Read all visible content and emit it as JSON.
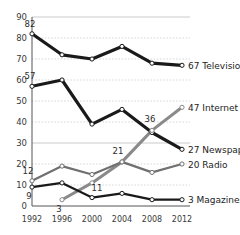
{
  "chart_data": {
    "type": "line",
    "title": "",
    "subtitle": "",
    "xlabel": "",
    "ylabel": "",
    "categories": [
      "1992",
      "1996",
      "2000",
      "2004",
      "2008",
      "2012"
    ],
    "ylim": [
      0,
      90
    ],
    "ytick_step": 10,
    "yticks": [
      "0",
      "10",
      "20",
      "30",
      "40",
      "50",
      "60",
      "70",
      "80",
      "90"
    ],
    "grid": true,
    "legend_position": "right-inline-end-of-line",
    "series": [
      {
        "name": "Television",
        "color": "#1a1a1a",
        "width": 3.2,
        "values": [
          82,
          72,
          70,
          76,
          68,
          67
        ],
        "start_label": "82",
        "end_label": "67",
        "end_name": "Television"
      },
      {
        "name": "Newspapers",
        "color": "#1a1a1a",
        "width": 3.2,
        "values": [
          57,
          60,
          39,
          46,
          35,
          27
        ],
        "start_label": "57",
        "end_label": "27",
        "end_name": "Newspapers"
      },
      {
        "name": "Internet",
        "color": "#8a8a8a",
        "width": 3.0,
        "values": [
          null,
          3,
          11,
          21,
          36,
          47
        ],
        "start_label": "3",
        "end_label": "47",
        "end_name": "Internet"
      },
      {
        "name": "Radio",
        "color": "#707070",
        "width": 2.2,
        "values": [
          12,
          19,
          15,
          21,
          16,
          20
        ],
        "start_label": "12",
        "end_label": "20",
        "end_name": "Radio"
      },
      {
        "name": "Magazines",
        "color": "#1a1a1a",
        "width": 2.2,
        "values": [
          9,
          11,
          4,
          6,
          3,
          3
        ],
        "start_label": "9",
        "end_label": "3",
        "end_name": "Magazines"
      }
    ],
    "annotations": [
      {
        "text": "82",
        "series": "Television",
        "x": "1992",
        "value": 82
      },
      {
        "text": "57",
        "series": "Newspapers",
        "x": "1992",
        "value": 57
      },
      {
        "text": "36",
        "series": "Internet",
        "x": "2008",
        "value": 36
      },
      {
        "text": "21",
        "series": "Internet",
        "x": "2004",
        "value": 21
      },
      {
        "text": "11",
        "series": "Internet",
        "x": "2000",
        "value": 11
      },
      {
        "text": "12",
        "series": "Radio",
        "x": "1992",
        "value": 12
      },
      {
        "text": "9",
        "series": "Magazines",
        "x": "1992",
        "value": 9
      },
      {
        "text": "3",
        "series": "Internet",
        "x": "1996",
        "value": 3
      }
    ]
  }
}
